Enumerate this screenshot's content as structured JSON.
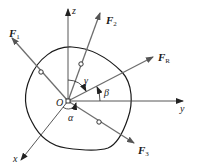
{
  "diagram": {
    "title": "",
    "origin_label": "O",
    "axes": {
      "x": "x",
      "y": "y",
      "z": "z"
    },
    "forces": [
      {
        "name": "F",
        "sub": "1"
      },
      {
        "name": "F",
        "sub": "2"
      },
      {
        "name": "F",
        "sub": "R"
      },
      {
        "name": "F",
        "sub": "3"
      }
    ],
    "angles": {
      "alpha": "α",
      "beta": "β",
      "gamma": "γ"
    },
    "colors": {
      "force": "#6e6e6e",
      "axis": "#444444",
      "body": "#1a1a1a"
    }
  }
}
